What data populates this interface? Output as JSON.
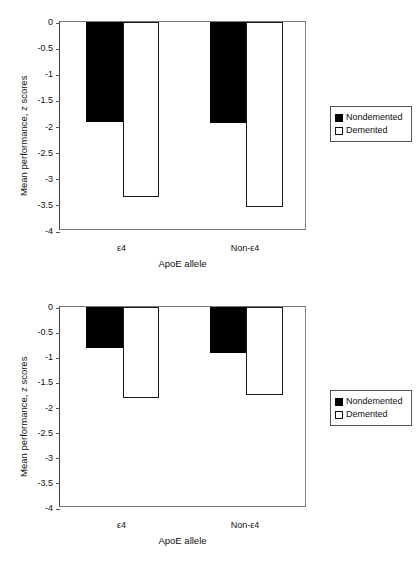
{
  "chart_data": [
    {
      "panel": "top",
      "type": "bar",
      "title": "",
      "xlabel": "ApoE allele",
      "ylabel": "Mean performance, z scores",
      "categories": [
        "ε4",
        "Non-ε4"
      ],
      "series": [
        {
          "name": "Nondemented",
          "values": [
            -1.92,
            -1.94
          ],
          "color": "#000000"
        },
        {
          "name": "Demented",
          "values": [
            -3.35,
            -3.55
          ],
          "color": "#ffffff"
        }
      ],
      "ylim": [
        -4,
        0
      ],
      "yticks": [
        "0",
        "-0.5",
        "-1",
        "-1.5",
        "-2",
        "-2.5",
        "-3",
        "-3.5",
        "-4"
      ],
      "ytick_values": [
        0,
        -0.5,
        -1,
        -1.5,
        -2,
        -2.5,
        -3,
        -3.5,
        -4
      ],
      "grid": false,
      "legend_position": "right"
    },
    {
      "panel": "bottom",
      "type": "bar",
      "title": "",
      "xlabel": "ApoE allele",
      "ylabel": "Mean performance, z scores",
      "categories": [
        "ε4",
        "Non-ε4"
      ],
      "series": [
        {
          "name": "Nondemented",
          "values": [
            -0.82,
            -0.92
          ],
          "color": "#000000"
        },
        {
          "name": "Demented",
          "values": [
            -1.81,
            -1.76
          ],
          "color": "#ffffff"
        }
      ],
      "ylim": [
        -4,
        0
      ],
      "yticks": [
        "0",
        "-0.5",
        "-1",
        "-1.5",
        "-2",
        "-2.5",
        "-3",
        "-3.5",
        "-4"
      ],
      "ytick_values": [
        0,
        -0.5,
        -1,
        -1.5,
        -2,
        -2.5,
        -3,
        -3.5,
        -4
      ],
      "grid": false,
      "legend_position": "right"
    }
  ]
}
